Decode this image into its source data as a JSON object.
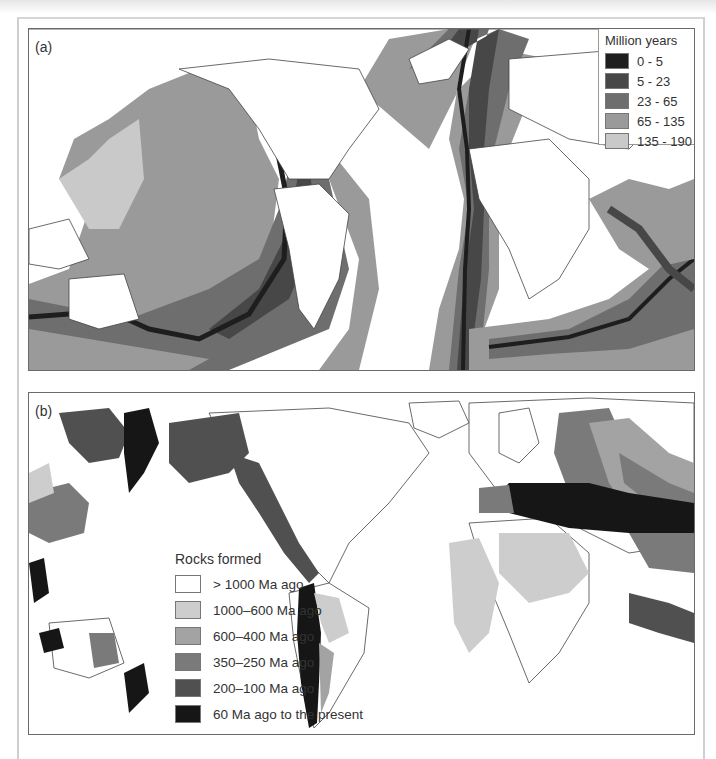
{
  "figure": {
    "panel_a": {
      "label": "(a)",
      "legend": {
        "title": "Million years",
        "items": [
          {
            "label": "0 - 5",
            "color": "#1e1e1e"
          },
          {
            "label": "5 - 23",
            "color": "#474747"
          },
          {
            "label": "23 - 65",
            "color": "#6e6e6e"
          },
          {
            "label": "65 - 135",
            "color": "#9a9a9a"
          },
          {
            "label": "135 - 190",
            "color": "#c9c9c9"
          }
        ]
      }
    },
    "panel_b": {
      "label": "(b)",
      "legend": {
        "title": "Rocks formed",
        "items": [
          {
            "label": "> 1000 Ma ago",
            "color": "#ffffff"
          },
          {
            "label": "1000–600 Ma ago",
            "color": "#cdcdcd"
          },
          {
            "label": "600–400 Ma ago",
            "color": "#a3a3a3"
          },
          {
            "label": "350–250 Ma ago",
            "color": "#7a7a7a"
          },
          {
            "label": "200–100 Ma ago",
            "color": "#505050"
          },
          {
            "label": "60 Ma ago to the present",
            "color": "#161616"
          }
        ]
      }
    }
  }
}
